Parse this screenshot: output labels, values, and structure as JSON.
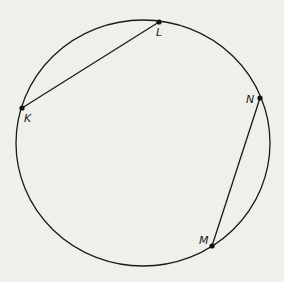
{
  "diagram": {
    "type": "circle-with-chords",
    "background": "#efefec",
    "stroke_color": "#1a1a1a",
    "circle": {
      "cx": 143,
      "cy": 143,
      "rx": 127,
      "ry": 123
    },
    "points": [
      {
        "name": "L",
        "x": 159,
        "y": 22,
        "label_x": 156,
        "label_y": 36
      },
      {
        "name": "K",
        "x": 22,
        "y": 108,
        "label_x": 24,
        "label_y": 122
      },
      {
        "name": "N",
        "x": 260,
        "y": 98,
        "label_x": 246,
        "label_y": 103
      },
      {
        "name": "M",
        "x": 212,
        "y": 246,
        "label_x": 199,
        "label_y": 244
      }
    ],
    "chords": [
      {
        "from": "K",
        "to": "L"
      },
      {
        "from": "N",
        "to": "M"
      }
    ]
  }
}
